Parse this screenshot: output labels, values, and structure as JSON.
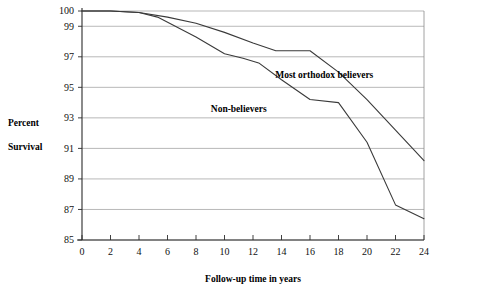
{
  "chart_data": {
    "type": "line",
    "title": "",
    "xlabel": "Follow-up time in years",
    "ylabel_lines": [
      "Percent",
      "Survival"
    ],
    "xlim": [
      0,
      24
    ],
    "ylim": [
      85,
      100
    ],
    "xticks": [
      0,
      2,
      4,
      6,
      8,
      10,
      12,
      14,
      16,
      18,
      20,
      22,
      24
    ],
    "yticks": [
      85,
      87,
      89,
      91,
      93,
      95,
      97,
      99,
      100
    ],
    "grid": true,
    "legend_position": "inline-annotations",
    "series": [
      {
        "name": "Most orthodox believers",
        "label_x": 17.0,
        "label_y": 95.6,
        "color": "#3a3a3a",
        "x": [
          0,
          2,
          4,
          6,
          8,
          10,
          12,
          13.6,
          16,
          18,
          20,
          22,
          24
        ],
        "values": [
          100,
          100,
          99.9,
          99.6,
          99.2,
          98.6,
          97.9,
          97.4,
          97.4,
          96.0,
          94.2,
          92.2,
          90.2
        ]
      },
      {
        "name": "Non-believers",
        "label_x": 11.0,
        "label_y": 93.4,
        "color": "#3a3a3a",
        "x": [
          0,
          2,
          4,
          5.3,
          8,
          10,
          11.3,
          12.4,
          14,
          16,
          18,
          20,
          22,
          24
        ],
        "values": [
          100,
          100,
          99.9,
          99.6,
          98.3,
          97.2,
          96.9,
          96.6,
          95.5,
          94.2,
          94.0,
          91.4,
          87.3,
          86.4
        ]
      }
    ],
    "annotations": [
      {
        "text": "Most orthodox believers",
        "x": 17.0,
        "y": 95.6
      },
      {
        "text": "Non-believers",
        "x": 11.0,
        "y": 93.4
      }
    ]
  }
}
